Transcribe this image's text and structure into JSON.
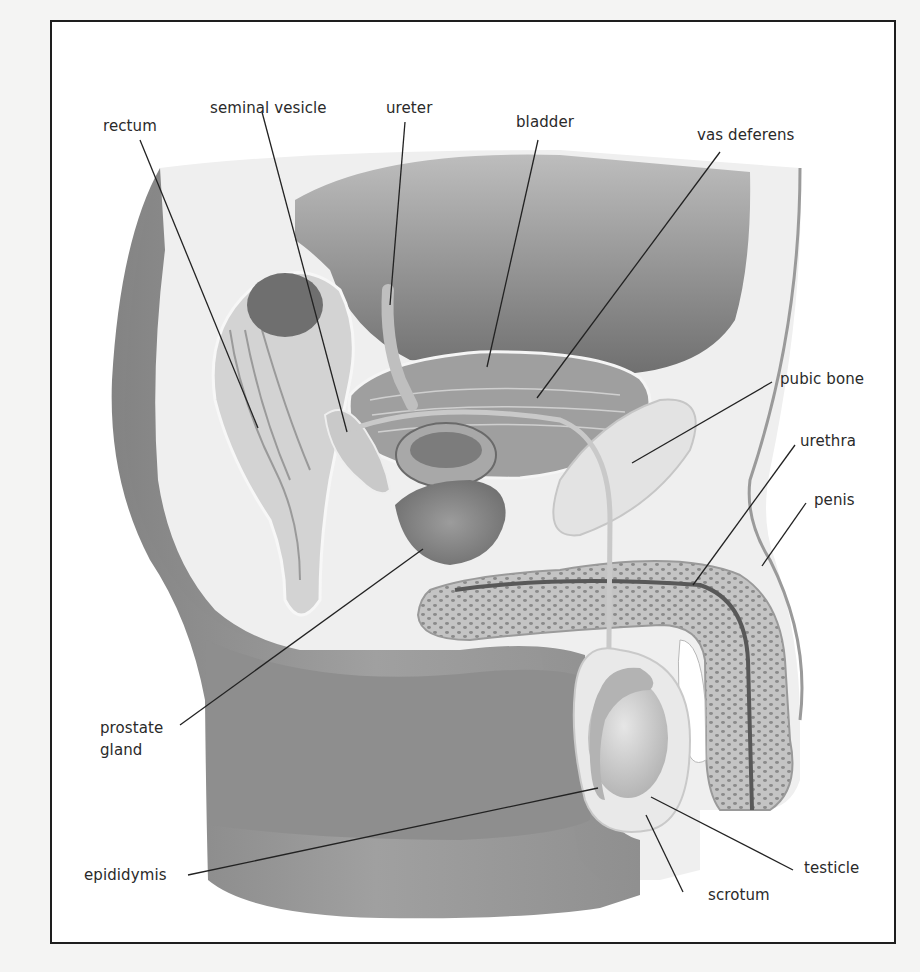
{
  "diagram": {
    "type": "anatomical illustration",
    "colors": {
      "background": "#ffffff",
      "frame": "#1e1e1e",
      "body_shadow": "#8c8c8c",
      "tissue_mid": "#a9a9a9",
      "tissue_light": "#d8d8d8",
      "leader_line": "#222222",
      "label_text": "#2a2a2a"
    }
  },
  "labels": {
    "rectum": "rectum",
    "seminal_vesicle": "seminal vesicle",
    "ureter": "ureter",
    "bladder": "bladder",
    "vas_deferens": "vas deferens",
    "pubic_bone": "pubic bone",
    "urethra": "urethra",
    "penis": "penis",
    "prostate_gland_line1": "prostate",
    "prostate_gland_line2": "gland",
    "epididymis": "epididymis",
    "testicle": "testicle",
    "scrotum": "scrotum"
  }
}
